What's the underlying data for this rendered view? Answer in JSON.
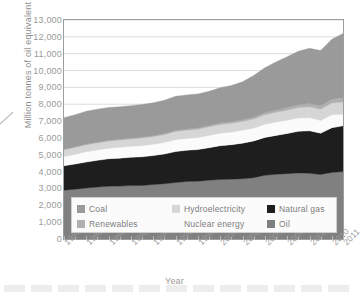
{
  "title_fragment": "",
  "axes": {
    "ylabel": "Million tonnes of oil equivalent",
    "xlabel": "Year",
    "yticks": [
      "0",
      "1,000",
      "2,000",
      "3,000",
      "4,000",
      "5,000",
      "6,000",
      "7,000",
      "8,000",
      "9,000",
      "10,000",
      "11,000",
      "12,000",
      "13,000"
    ],
    "xticks": [
      "1986",
      "1988",
      "1990",
      "1992",
      "1994",
      "1996",
      "1998",
      "2000",
      "2002",
      "2004",
      "2006",
      "2008",
      "2010",
      "2011"
    ]
  },
  "legend": {
    "items": [
      {
        "label": "Coal",
        "color": "#9a9a9a",
        "col": 1,
        "row": 1
      },
      {
        "label": "Hydroelectricity",
        "color": "#d6d6d6",
        "col": 2,
        "row": 1
      },
      {
        "label": "Natural gas",
        "color": "#1e1e1e",
        "col": 3,
        "row": 1
      },
      {
        "label": "Renewables",
        "color": "#b0b0b0",
        "col": 1,
        "row": 2
      },
      {
        "label": "Nuclear energy",
        "color": "#fbfbfb",
        "col": 2,
        "row": 2
      },
      {
        "label": "Oil",
        "color": "#808080",
        "col": 3,
        "row": 2
      }
    ]
  },
  "chart_data": {
    "type": "area",
    "stacked": true,
    "xlabel": "Year",
    "ylabel": "Million tonnes of oil equivalent",
    "ylim": [
      0,
      13000
    ],
    "ytick_step": 1000,
    "grid": true,
    "legend_position": "inside-bottom",
    "x": [
      1986,
      1987,
      1988,
      1989,
      1990,
      1991,
      1992,
      1993,
      1994,
      1995,
      1996,
      1997,
      1998,
      1999,
      2000,
      2001,
      2002,
      2003,
      2004,
      2005,
      2006,
      2007,
      2008,
      2009,
      2010,
      2011
    ],
    "stack_order_bottom_to_top": [
      "Oil",
      "Natural gas",
      "Nuclear energy",
      "Hydroelectricity",
      "Renewables",
      "Coal"
    ],
    "series": [
      {
        "name": "Oil",
        "color": "#808080",
        "values": [
          2900,
          2960,
          3030,
          3080,
          3130,
          3140,
          3170,
          3180,
          3230,
          3280,
          3350,
          3420,
          3430,
          3490,
          3530,
          3550,
          3580,
          3640,
          3780,
          3840,
          3880,
          3920,
          3900,
          3830,
          3950,
          4000
        ]
      },
      {
        "name": "Natural gas",
        "color": "#1e1e1e",
        "values": [
          1450,
          1490,
          1540,
          1590,
          1630,
          1660,
          1680,
          1700,
          1720,
          1770,
          1840,
          1850,
          1880,
          1930,
          2010,
          2050,
          2110,
          2180,
          2250,
          2310,
          2380,
          2470,
          2520,
          2450,
          2650,
          2720
        ]
      },
      {
        "name": "Nuclear energy",
        "color": "#fbfbfb",
        "values": [
          550,
          580,
          610,
          620,
          630,
          640,
          650,
          660,
          670,
          680,
          700,
          700,
          710,
          730,
          740,
          750,
          760,
          760,
          780,
          790,
          790,
          790,
          780,
          760,
          770,
          690
        ]
      },
      {
        "name": "Hydroelectricity",
        "color": "#d6d6d6",
        "values": [
          400,
          410,
          420,
          420,
          430,
          440,
          440,
          460,
          460,
          470,
          490,
          490,
          500,
          510,
          520,
          520,
          530,
          540,
          560,
          580,
          600,
          620,
          650,
          660,
          700,
          720
        ]
      },
      {
        "name": "Renewables",
        "color": "#b0b0b0",
        "values": [
          30,
          32,
          35,
          38,
          40,
          43,
          46,
          49,
          52,
          56,
          60,
          65,
          70,
          76,
          83,
          90,
          98,
          108,
          120,
          134,
          150,
          168,
          188,
          205,
          230,
          260
        ]
      },
      {
        "name": "Coal",
        "color": "#9a9a9a",
        "values": [
          1870,
          1900,
          1950,
          1960,
          1940,
          1930,
          1930,
          1940,
          1950,
          1980,
          2030,
          2030,
          2020,
          2030,
          2100,
          2150,
          2250,
          2480,
          2680,
          2860,
          3020,
          3180,
          3280,
          3280,
          3550,
          3810
        ]
      }
    ],
    "totals": [
      7200,
      7372,
      7585,
      7708,
      7800,
      7853,
      7916,
      7989,
      8082,
      8236,
      8470,
      8555,
      8610,
      8766,
      8983,
      9110,
      9328,
      9708,
      10170,
      10514,
      10820,
      11148,
      11318,
      11185,
      11850,
      12200
    ]
  }
}
